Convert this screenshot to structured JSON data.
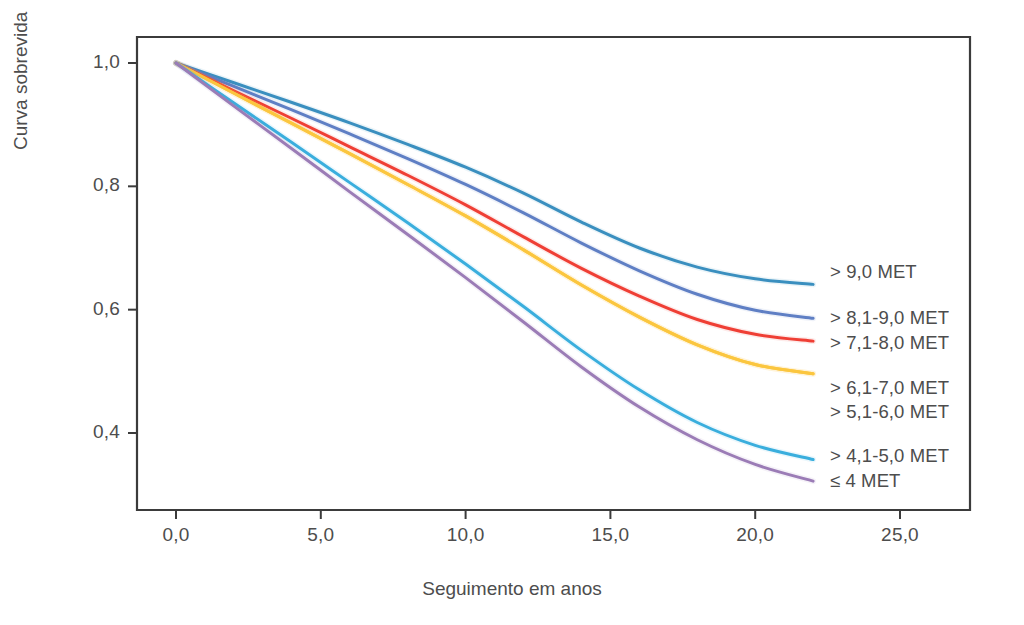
{
  "chart_data": {
    "type": "line",
    "title": "",
    "xlabel": "Seguimento em anos",
    "ylabel": "Curva sobrevida",
    "xlim": [
      -1.3,
      29.8
    ],
    "ylim": [
      0.28,
      1.035
    ],
    "xticks": [
      "0,0",
      "5,0",
      "10,0",
      "15,0",
      "20,0",
      "25,0"
    ],
    "xtick_values": [
      0,
      5,
      10,
      15,
      20,
      25
    ],
    "yticks": [
      "1,0",
      "0,8",
      "0,6",
      "0,4"
    ],
    "ytick_values": [
      1.0,
      0.8,
      0.6,
      0.4
    ],
    "grid": false,
    "legend_position": "right-inside",
    "x": [
      0,
      2,
      4,
      6,
      8,
      10,
      12,
      14,
      16,
      18,
      20,
      22
    ],
    "series": [
      {
        "name": "> 9,0 MET",
        "color": "#3a8fbf",
        "values": [
          1.0,
          0.968,
          0.936,
          0.903,
          0.868,
          0.831,
          0.789,
          0.742,
          0.7,
          0.669,
          0.65,
          0.641
        ]
      },
      {
        "name": "> 8,1-9,0 MET",
        "color": "#5f7fc4",
        "values": [
          1.0,
          0.962,
          0.924,
          0.885,
          0.845,
          0.803,
          0.757,
          0.708,
          0.663,
          0.625,
          0.599,
          0.586
        ]
      },
      {
        "name": "> 7,1-8,0 MET",
        "color": "#ef3f35",
        "values": [
          1.0,
          0.955,
          0.91,
          0.864,
          0.818,
          0.77,
          0.718,
          0.667,
          0.622,
          0.584,
          0.56,
          0.549
        ]
      },
      {
        "name": "> 6,1-7,0 MET",
        "color": "#fbc63f",
        "values": [
          1.0,
          0.951,
          0.902,
          0.853,
          0.803,
          0.752,
          0.697,
          0.64,
          0.588,
          0.543,
          0.511,
          0.496
        ]
      },
      {
        "name": "> 5,1-6,0 MET",
        "color": "#fbc63f",
        "values": [
          1.0,
          0.951,
          0.902,
          0.853,
          0.803,
          0.752,
          0.697,
          0.64,
          0.588,
          0.543,
          0.511,
          0.496
        ]
      },
      {
        "name": "> 4,1-5,0 MET",
        "color": "#3aaedd",
        "values": [
          1.0,
          0.935,
          0.871,
          0.806,
          0.741,
          0.674,
          0.605,
          0.534,
          0.47,
          0.417,
          0.38,
          0.357
        ]
      },
      {
        "name": "≤ 4 MET",
        "color": "#9b7cb6",
        "values": [
          1.0,
          0.93,
          0.861,
          0.791,
          0.722,
          0.652,
          0.58,
          0.507,
          0.442,
          0.389,
          0.349,
          0.322
        ]
      }
    ],
    "legend_entries": [
      {
        "label": "> 9,0 MET",
        "color": "#3a8fbf",
        "y": 272
      },
      {
        "label": "> 8,1-9,0 MET",
        "color": "#5f7fc4",
        "y": 318
      },
      {
        "label": "> 7,1-8,0 MET",
        "color": "#ef3f35",
        "y": 343
      },
      {
        "label": "> 6,1-7,0 MET",
        "color": "#fbc63f",
        "y": 388
      },
      {
        "label": "> 5,1-6,0 MET",
        "color": "#fbc63f",
        "y": 412
      },
      {
        "label": "> 4,1-5,0 MET",
        "color": "#3aaedd",
        "y": 456
      },
      {
        "label": "≤ 4 MET",
        "color": "#9b7cb6",
        "y": 481
      }
    ],
    "axis_color": "#3b3b3b"
  }
}
